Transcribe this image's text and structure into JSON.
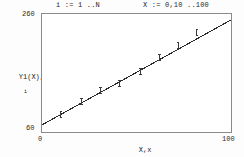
{
  "window": {
    "title": "Mathcad linear regression plot"
  },
  "annotations": {
    "index_definition": "i := 1 ..N",
    "range_definition": "X := 0,10 ..100"
  },
  "axes": {
    "y_max_label": "260",
    "y_min_label": "60",
    "x_min_label": "0",
    "x_max_label": "100",
    "y_title_main": "Y1(X),y",
    "y_title_sub": "i",
    "x_title_main": "X,x",
    "x_title_sub": "i"
  },
  "style": {
    "frame_color": "#8a8a8a",
    "line_color": "#2b2b2b",
    "marker_color": "#3a3a3a",
    "text_color": "#262626",
    "background": "#ffffff"
  },
  "chart_data": {
    "type": "scatter",
    "title": "",
    "subtitle": "",
    "xlabel": "X,x i",
    "ylabel": "Y1(X),y i",
    "xlim": [
      0,
      100
    ],
    "ylim": [
      60,
      260
    ],
    "grid": false,
    "legend": null,
    "xticks": [
      0,
      100
    ],
    "yticks": [
      60,
      260
    ],
    "series": [
      {
        "name": "y_i",
        "type": "scatter",
        "marker": "vertical-bar",
        "x": [
          10,
          21,
          31,
          41,
          52,
          62,
          72,
          82
        ],
        "y": [
          89,
          111,
          130,
          143,
          163,
          187,
          207,
          229
        ]
      },
      {
        "name": "Y1(X)",
        "type": "line",
        "x": [
          0,
          100
        ],
        "y": [
          72,
          250
        ]
      }
    ]
  }
}
